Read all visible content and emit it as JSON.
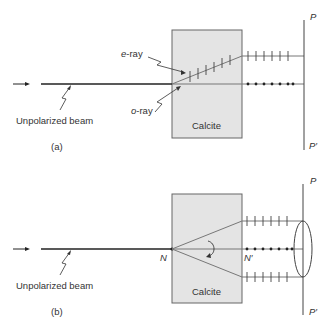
{
  "panel_a": {
    "caption": "(a)",
    "beam_label": "Unpolarized beam",
    "e_ray_label_prefix": "e",
    "e_ray_label_suffix": "-ray",
    "o_ray_label_prefix": "o",
    "o_ray_label_suffix": "-ray",
    "crystal_label": "Calcite",
    "screen_top": "P",
    "screen_bottom": "P′"
  },
  "panel_b": {
    "caption": "(b)",
    "beam_label": "Unpolarized beam",
    "crystal_label": "Calcite",
    "point_n": "N",
    "point_n_prime": "N′",
    "screen_top": "P",
    "screen_bottom": "P′"
  },
  "colors": {
    "crystal_fill": "#e4e4e4",
    "crystal_stroke": "#666666",
    "ray": "#555555",
    "beam": "#222222"
  }
}
